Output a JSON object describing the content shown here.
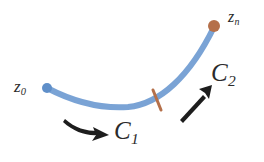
{
  "figure": {
    "background_color": "#ffffff",
    "width": 264,
    "height": 162
  },
  "colors": {
    "curve_blue": "#6f9bd1",
    "start_dot_blue": "#5f8fc9",
    "end_dot_rust": "#b5704a",
    "tick_rust": "#b5704a",
    "arrow_black": "#1d1d1d",
    "label_text": "#2b2b2b"
  },
  "curve": {
    "name": "contour",
    "description": "smooth concave-up curve from z0 rising to zn",
    "stroke_width": 6,
    "path": "M 47 88 C 72 101, 100 109, 128 107 C 160 104, 190 76, 214 27",
    "start_point": {
      "x": 47,
      "y": 88
    },
    "end_point": {
      "x": 214,
      "y": 27
    },
    "division_point": {
      "x": 157,
      "y": 99
    }
  },
  "points": [
    {
      "id": "z0",
      "label": "z",
      "subscript": "0",
      "dot_color": "#5f8fc9",
      "dot_radius": 5,
      "cx": 47,
      "cy": 88
    },
    {
      "id": "zn",
      "label": "z",
      "subscript": "n",
      "dot_color": "#b5704a",
      "dot_radius": 6,
      "cx": 214,
      "cy": 26
    }
  ],
  "tick": {
    "name": "division-tick",
    "color": "#b5704a",
    "x1": 153,
    "y1": 90,
    "x2": 161,
    "y2": 110,
    "stroke_width": 3
  },
  "segments": [
    {
      "id": "C1",
      "label": "C",
      "subscript": "1",
      "arrow_direction": "right",
      "arrow_style": "curved"
    },
    {
      "id": "C2",
      "label": "C",
      "subscript": "2",
      "arrow_direction": "up-right",
      "arrow_style": "straight"
    }
  ],
  "arrows": [
    {
      "id": "arrow-c1",
      "name": "c1-direction-arrow",
      "color": "#1d1d1d",
      "from": {
        "x": 64,
        "y": 124
      },
      "to": {
        "x": 107,
        "y": 136
      }
    },
    {
      "id": "arrow-c2",
      "name": "c2-direction-arrow",
      "color": "#1d1d1d",
      "from": {
        "x": 181,
        "y": 118
      },
      "to": {
        "x": 212,
        "y": 86
      }
    }
  ]
}
